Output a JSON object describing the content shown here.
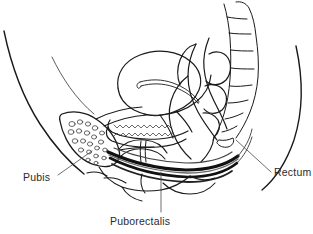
{
  "figure": {
    "type": "anatomical-line-drawing",
    "width": 313,
    "height": 234,
    "background_color": "#ffffff",
    "line_color": "#1a1a1a",
    "shading_color": "#555555",
    "text_color": "#2b2b2b"
  },
  "labels": [
    {
      "id": "pubis",
      "text": "Pubis",
      "position": "lower-left",
      "leader": "from text up-right to pubic bone cross-section"
    },
    {
      "id": "rectum",
      "text": "Rectum",
      "position": "right",
      "leader": "from text up-left to rectal wall"
    },
    {
      "id": "puborectalis",
      "text": "Puborectalis",
      "position": "bottom-center",
      "leader": "vertical line up to dark muscle sling"
    }
  ],
  "structures": [
    {
      "name": "abdominal-wall-contour",
      "kind": "outline"
    },
    {
      "name": "buttock-contour",
      "kind": "outline"
    },
    {
      "name": "pubic-bone",
      "kind": "bone",
      "detail": "cancellous trabecular texture"
    },
    {
      "name": "sacrum-coccyx",
      "kind": "bone",
      "detail": "segmented vertebrae"
    },
    {
      "name": "uterus",
      "kind": "organ",
      "detail": "anteverted with endometrial cavity slit"
    },
    {
      "name": "vagina",
      "kind": "organ",
      "detail": "rugae lining shown as zigzag"
    },
    {
      "name": "bladder",
      "kind": "organ"
    },
    {
      "name": "urethra",
      "kind": "organ"
    },
    {
      "name": "rectum",
      "kind": "organ",
      "detail": "curving sigmoid and anal canal"
    },
    {
      "name": "puborectalis-muscle",
      "kind": "muscle",
      "detail": "dark sling band"
    },
    {
      "name": "perineum",
      "kind": "soft-tissue"
    }
  ]
}
